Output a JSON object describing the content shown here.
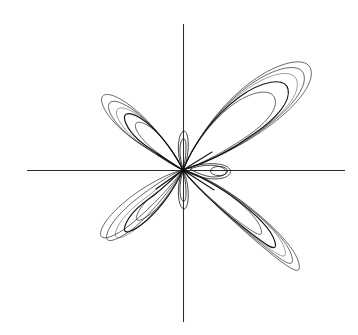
{
  "figure": {
    "title": "",
    "background_color": "#ffffff",
    "width": 358,
    "height": 335,
    "line_color": "#1d1d1d",
    "axis_color": "#2b2b2b"
  },
  "axes": {
    "x_axis_label": "",
    "y_axis_label": "",
    "origin_px": [
      183,
      170
    ],
    "x_axis_start_px": [
      27,
      170
    ],
    "x_axis_end_px": [
      345,
      170
    ],
    "y_axis_start_px": [
      183,
      24
    ],
    "y_axis_end_px": [
      183,
      322
    ],
    "ticks_shown": false,
    "tick_labels": [],
    "grid": false,
    "frame": false
  },
  "chart_data": {
    "type": "line",
    "title": "",
    "subtitle": "",
    "xlabel": "",
    "ylabel": "",
    "plot_kind": "parametric phase portrait",
    "xlim": [
      -1.0,
      1.05
    ],
    "ylim": [
      -1.0,
      0.98
    ],
    "grid": false,
    "legend": null,
    "legend_position": "none",
    "annotations": [],
    "series": [
      {
        "name": "petal-upper-right",
        "n_loops": 5,
        "tilt_deg": 42,
        "extent_px": [
          310,
          62
        ],
        "tip_px": [
          183,
          170
        ]
      },
      {
        "name": "petal-upper-left",
        "n_loops": 5,
        "tilt_deg": 138,
        "extent_px": [
          102,
          95
        ],
        "tip_px": [
          183,
          170
        ]
      },
      {
        "name": "petal-lower-left",
        "n_loops": 5,
        "tilt_deg": 222,
        "extent_px": [
          103,
          252
        ],
        "tip_px": [
          183,
          170
        ]
      },
      {
        "name": "petal-lower-right",
        "n_loops": 5,
        "tilt_deg": 318,
        "extent_px": [
          300,
          285
        ],
        "tip_px": [
          183,
          170
        ]
      },
      {
        "name": "axial-lens-loop",
        "n_loops": 2,
        "center_px": [
          219,
          171
        ],
        "rx_px": 11,
        "ry_px": 5
      },
      {
        "name": "vertical-sliver-up",
        "n_loops": 2,
        "center_px": [
          183,
          148
        ],
        "rx_px": 3,
        "ry_px": 13
      },
      {
        "name": "vertical-sliver-down",
        "n_loops": 2,
        "center_px": [
          183,
          193
        ],
        "rx_px": 3,
        "ry_px": 13
      }
    ]
  }
}
